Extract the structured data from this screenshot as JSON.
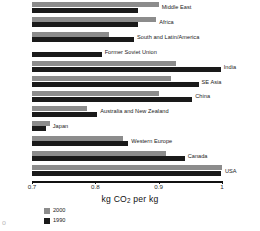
{
  "chart_data": {
    "type": "bar",
    "orientation": "horizontal",
    "title": "",
    "xlabel": "kg CO2  per kg",
    "ylabel": "",
    "xlim": [
      0.7,
      1.0
    ],
    "xticks": [
      "0.7",
      "0.8",
      "0.9",
      "1"
    ],
    "grid": false,
    "legend_position": "bottom-left",
    "categories": [
      "Middle East",
      "Africa",
      "South and Latin/America",
      "Former Soviet Union",
      "India",
      "SE Asia",
      "China",
      "Australia and New Zealand",
      "Japan",
      "Western Europe",
      "Canada",
      "USA"
    ],
    "series": [
      {
        "name": "2000",
        "color": "#8c8c8c",
        "values": [
          0.9,
          0.896,
          0.821,
          0.7,
          0.927,
          0.92,
          0.9,
          0.787,
          0.728,
          0.843,
          0.911,
          1.0
        ]
      },
      {
        "name": "1990",
        "color": "#1a1a1a",
        "values": [
          0.867,
          0.867,
          0.861,
          0.81,
          0.998,
          0.963,
          0.953,
          0.803,
          0.722,
          0.852,
          0.941,
          0.998
        ]
      }
    ]
  },
  "axis": {
    "title": "kg CO",
    "title_sub": "2",
    "title_tail": "  per kg",
    "ticks": [
      "0.7",
      "0.8",
      "0.9",
      "1"
    ]
  },
  "legend": {
    "items": [
      {
        "label": "2000",
        "color": "#8c8c8c"
      },
      {
        "label": "1990",
        "color": "#1a1a1a"
      }
    ]
  },
  "artifact": {
    "mark": "o"
  }
}
